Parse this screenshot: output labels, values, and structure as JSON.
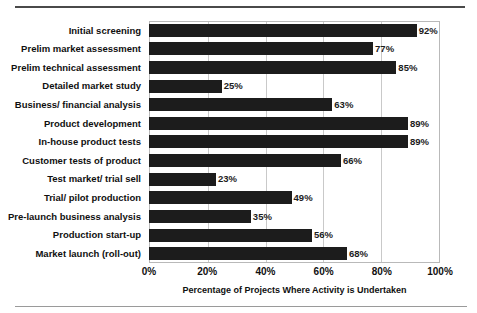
{
  "chart_data": {
    "type": "bar",
    "orientation": "horizontal",
    "title": "",
    "xlabel": "Percentage of Projects Where Activity is Undertaken",
    "ylabel": "",
    "xlim": [
      0,
      100
    ],
    "xticks": [
      "0%",
      "20%",
      "40%",
      "60%",
      "80%",
      "100%"
    ],
    "xtick_values": [
      0,
      20,
      40,
      60,
      80,
      100
    ],
    "grid": "vertical",
    "legend": "none",
    "bar_color": "#1c1c1c",
    "gridline_color": "#c9c9c9",
    "frame_color": "#b9b9b9",
    "categories": [
      "Initial screening",
      "Prelim market assessment",
      "Prelim technical assessment",
      "Detailed market study",
      "Business/ financial analysis",
      "Product development",
      "In-house product tests",
      "Customer tests of product",
      "Test market/ trial sell",
      "Trial/ pilot production",
      "Pre-launch business analysis",
      "Production start-up",
      "Market launch (roll-out)"
    ],
    "values": [
      92,
      77,
      85,
      25,
      63,
      89,
      89,
      66,
      23,
      49,
      35,
      56,
      68
    ],
    "value_labels": [
      "92%",
      "77%",
      "85%",
      "25%",
      "63%",
      "89%",
      "89%",
      "66%",
      "23%",
      "49%",
      "35%",
      "56%",
      "68%"
    ]
  }
}
